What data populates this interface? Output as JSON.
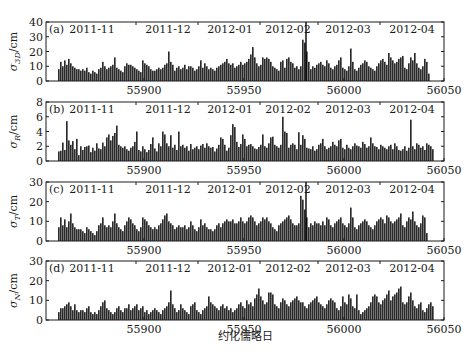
{
  "figure": {
    "xlabel": "约化儒略日",
    "x_range": [
      55851,
      56050
    ],
    "x_ticks": [
      55900,
      55950,
      56000,
      56050
    ],
    "month_labels": [
      "2011-11",
      "2011-12",
      "2012-01",
      "2012-02",
      "2012-03",
      "2012-04"
    ],
    "month_boundaries_mjd": [
      55896,
      55927,
      55958,
      55987,
      56018
    ],
    "month_label_mjd": [
      55874,
      55912,
      55943,
      55972,
      56002,
      56034
    ],
    "bar_color": "#2a2a2a",
    "axis_color": "#1a1a1a"
  },
  "chart_data": [
    {
      "type": "bar",
      "panel": "(a)",
      "title": "",
      "ylabel": "σ_3D/cm",
      "ylabel_main": "σ",
      "ylabel_sub": "3D",
      "ylabel_unit": "/cm",
      "xlabel": "约化儒略日",
      "ylim": [
        0,
        40
      ],
      "yticks": [
        0,
        10,
        20,
        30,
        40
      ],
      "x_start": 55857,
      "marker_line_mjd": 55981,
      "values": [
        8,
        13,
        10,
        14,
        11,
        15,
        12,
        10,
        9,
        8,
        8,
        7,
        8,
        7,
        9,
        6,
        5,
        7,
        6,
        5,
        8,
        9,
        13,
        10,
        8,
        9,
        10,
        11,
        16,
        9,
        8,
        7,
        6,
        10,
        12,
        11,
        11,
        10,
        9,
        8,
        7,
        6,
        14,
        12,
        11,
        10,
        8,
        7,
        7,
        8,
        9,
        8,
        9,
        11,
        12,
        20,
        13,
        11,
        7,
        9,
        10,
        8,
        9,
        11,
        8,
        10,
        10,
        9,
        7,
        8,
        10,
        14,
        9,
        12,
        10,
        8,
        9,
        8,
        7,
        9,
        10,
        11,
        12,
        13,
        15,
        12,
        11,
        12,
        9,
        10,
        11,
        13,
        11,
        12,
        13,
        15,
        18,
        23,
        16,
        12,
        10,
        11,
        16,
        15,
        16,
        15,
        13,
        10,
        9,
        8,
        7,
        13,
        14,
        9,
        15,
        16,
        13,
        12,
        9,
        10,
        8,
        10,
        28,
        26,
        20,
        13,
        8,
        10,
        9,
        11,
        12,
        13,
        11,
        10,
        14,
        12,
        9,
        8,
        10,
        11,
        14,
        16,
        9,
        8,
        7,
        10,
        22,
        13,
        8,
        7,
        9,
        11,
        12,
        14,
        13,
        10,
        9,
        8,
        7,
        10,
        12,
        14,
        15,
        13,
        11,
        19,
        16,
        14,
        12,
        13,
        15,
        16,
        17,
        9,
        8,
        12,
        16,
        14,
        19,
        12,
        9,
        8,
        10,
        15,
        13,
        5
      ]
    },
    {
      "type": "bar",
      "panel": "(b)",
      "title": "",
      "ylabel": "σ_R/cm",
      "ylabel_main": "σ",
      "ylabel_sub": "R",
      "ylabel_unit": "/cm",
      "xlabel": "约化儒略日",
      "ylim": [
        0,
        8
      ],
      "yticks": [
        0,
        2,
        4,
        6,
        8
      ],
      "x_start": 55857,
      "values": [
        1.3,
        1.4,
        2.5,
        1.5,
        5.4,
        2.8,
        2.2,
        2.7,
        1.6,
        3.0,
        0.8,
        2.0,
        1.5,
        1.9,
        2.0,
        2.1,
        1.2,
        1.8,
        1.4,
        2.4,
        1.7,
        1.6,
        2.5,
        2.0,
        3.2,
        3.6,
        2.8,
        3.4,
        3.8,
        4.8,
        2.2,
        2.0,
        1.8,
        2.0,
        1.6,
        1.4,
        1.8,
        2.0,
        2.6,
        4.0,
        1.5,
        1.3,
        2.0,
        1.6,
        1.2,
        1.5,
        2.3,
        3.2,
        1.7,
        1.3,
        2.4,
        2.0,
        4.0,
        3.6,
        2.4,
        2.0,
        3.5,
        1.8,
        2.2,
        1.5,
        4.0,
        2.0,
        2.2,
        1.8,
        2.0,
        1.4,
        2.3,
        1.6,
        1.8,
        2.0,
        1.6,
        2.1,
        2.3,
        1.8,
        2.4,
        2.0,
        1.8,
        1.9,
        1.3,
        1.7,
        2.2,
        3.2,
        3.0,
        2.2,
        1.4,
        1.8,
        3.5,
        5.0,
        4.6,
        2.6,
        1.9,
        2.3,
        3.6,
        3.0,
        2.0,
        2.2,
        2.3,
        2.0,
        1.7,
        1.6,
        1.9,
        2.2,
        3.6,
        2.0,
        1.8,
        2.4,
        3.2,
        3.3,
        2.2,
        2.0,
        1.8,
        2.2,
        6.0,
        4.0,
        3.8,
        1.8,
        2.2,
        2.4,
        2.2,
        1.6,
        3.9,
        2.2,
        3.5,
        3.0,
        1.8,
        1.7,
        1.6,
        2.0,
        1.4,
        1.6,
        2.2,
        2.4,
        3.0,
        2.0,
        1.6,
        1.8,
        2.0,
        2.6,
        2.2,
        2.0,
        2.8,
        3.0,
        1.8,
        1.6,
        2.2,
        1.8,
        1.6,
        2.0,
        2.4,
        2.1,
        2.0,
        1.8,
        2.6,
        2.3,
        1.8,
        2.0,
        3.2,
        2.4,
        2.0,
        1.9,
        1.6,
        2.2,
        2.0,
        1.8,
        1.6,
        2.0,
        2.2,
        1.6,
        2.4,
        2.0,
        1.5,
        1.4,
        1.6,
        2.0,
        1.4,
        1.8,
        5.6,
        2.0,
        1.6,
        2.4,
        2.2,
        1.8,
        2.0,
        1.5,
        2.4,
        2.2,
        2.0,
        1.6
      ]
    },
    {
      "type": "bar",
      "panel": "(c)",
      "title": "",
      "ylabel": "σ_T/cm",
      "ylabel_main": "σ",
      "ylabel_sub": "T",
      "ylabel_unit": "/cm",
      "xlabel": "约化儒略日",
      "ylim": [
        0,
        30
      ],
      "yticks": [
        0,
        10,
        20,
        30
      ],
      "x_start": 55857,
      "marker_line_mjd": 55981,
      "values": [
        7,
        12,
        8,
        11,
        7,
        10,
        14,
        9,
        7,
        6,
        6,
        6,
        5,
        4,
        7,
        6,
        5,
        4,
        3,
        5,
        8,
        9,
        12,
        8,
        7,
        8,
        7,
        10,
        14,
        9,
        7,
        6,
        5,
        8,
        10,
        12,
        11,
        9,
        8,
        6,
        5,
        7,
        12,
        11,
        10,
        8,
        7,
        6,
        7,
        6,
        8,
        9,
        11,
        13,
        14,
        10,
        9,
        8,
        6,
        7,
        8,
        7,
        7,
        8,
        6,
        7,
        10,
        8,
        6,
        5,
        7,
        11,
        8,
        9,
        7,
        6,
        6,
        5,
        6,
        8,
        9,
        7,
        9,
        10,
        11,
        10,
        10,
        11,
        9,
        9,
        10,
        12,
        10,
        9,
        10,
        12,
        13,
        12,
        10,
        8,
        9,
        10,
        12,
        11,
        12,
        10,
        9,
        7,
        6,
        5,
        8,
        9,
        10,
        11,
        12,
        13,
        11,
        9,
        8,
        8,
        9,
        23,
        21,
        16,
        12,
        7,
        9,
        8,
        10,
        9,
        9,
        8,
        10,
        8,
        12,
        11,
        8,
        7,
        9,
        10,
        11,
        12,
        9,
        8,
        7,
        9,
        17,
        12,
        7,
        6,
        8,
        9,
        10,
        11,
        10,
        8,
        7,
        6,
        8,
        10,
        11,
        12,
        11,
        9,
        13,
        12,
        10,
        9,
        10,
        11,
        12,
        14,
        8,
        7,
        10,
        12,
        11,
        15,
        10,
        8,
        7,
        9,
        13,
        12,
        4
      ]
    },
    {
      "type": "bar",
      "panel": "(d)",
      "title": "",
      "ylabel": "σ_N/cm",
      "ylabel_main": "σ",
      "ylabel_sub": "N",
      "ylabel_unit": "/cm",
      "xlabel": "约化儒略日",
      "ylim": [
        0,
        30
      ],
      "yticks": [
        0,
        10,
        20,
        30
      ],
      "x_start": 55857,
      "values": [
        4,
        6,
        6,
        7,
        8,
        9,
        7,
        5,
        8,
        5,
        4,
        5,
        5,
        4,
        6,
        7,
        4,
        3,
        4,
        3,
        5,
        7,
        9,
        10,
        6,
        5,
        4,
        3,
        4,
        6,
        7,
        5,
        4,
        6,
        6,
        8,
        5,
        6,
        7,
        8,
        5,
        6,
        7,
        4,
        5,
        3,
        4,
        5,
        6,
        5,
        4,
        3,
        5,
        6,
        7,
        9,
        15,
        8,
        6,
        4,
        5,
        8,
        6,
        5,
        4,
        3,
        7,
        8,
        9,
        5,
        4,
        3,
        5,
        6,
        7,
        12,
        9,
        8,
        7,
        6,
        5,
        7,
        8,
        6,
        7,
        5,
        6,
        4,
        5,
        6,
        8,
        9,
        7,
        6,
        10,
        8,
        9,
        7,
        11,
        13,
        16,
        12,
        10,
        8,
        9,
        14,
        14,
        13,
        8,
        7,
        6,
        9,
        11,
        10,
        8,
        7,
        9,
        10,
        11,
        12,
        10,
        9,
        9,
        7,
        6,
        8,
        9,
        10,
        11,
        12,
        9,
        8,
        7,
        6,
        8,
        10,
        11,
        10,
        9,
        6,
        5,
        7,
        12,
        9,
        8,
        13,
        11,
        7,
        6,
        13,
        5,
        3,
        4,
        5,
        6,
        7,
        9,
        12,
        13,
        12,
        9,
        8,
        10,
        11,
        13,
        15,
        10,
        12,
        13,
        14,
        16,
        17,
        9,
        8,
        9,
        12,
        14,
        10,
        7,
        6,
        8,
        9,
        5,
        4,
        6,
        8,
        9,
        7
      ]
    }
  ]
}
